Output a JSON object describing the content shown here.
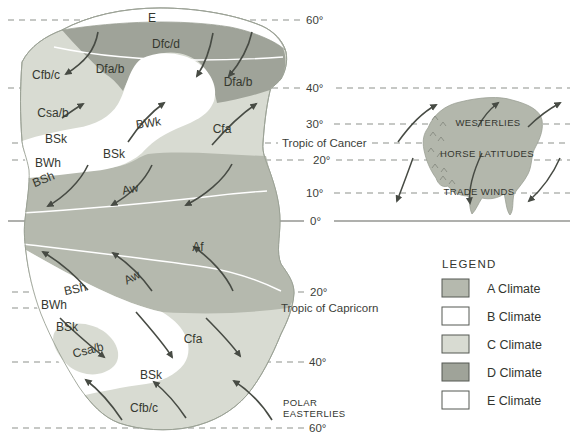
{
  "colors": {
    "background": "#ffffff",
    "a_climate": "#b5b9ae",
    "b_climate": "#ffffff",
    "c_climate": "#d8dbd2",
    "d_climate": "#9fa399",
    "e_climate": "#ffffff",
    "inset_land": "#b3b7ac",
    "coastline": "#9aa094",
    "latitude_line": "#8e918b",
    "equator_line": "#60635d",
    "arrow": "#474b44",
    "legend_border": "#55585200"
  },
  "climate_zone_labels": [
    {
      "text": "E"
    },
    {
      "text": "Dfc/d"
    },
    {
      "text": "Dfa/b"
    },
    {
      "text": "Dfa/b"
    },
    {
      "text": "Cfb/c"
    },
    {
      "text": "Csa/b"
    },
    {
      "text": "BWk"
    },
    {
      "text": "BSk"
    },
    {
      "text": "BSk"
    },
    {
      "text": "BWh"
    },
    {
      "text": "BSh"
    },
    {
      "text": "Cfa"
    },
    {
      "text": "Aw"
    },
    {
      "text": "Af"
    },
    {
      "text": "Aw"
    },
    {
      "text": "BSh"
    },
    {
      "text": "BWh"
    },
    {
      "text": "BSk"
    },
    {
      "text": "Csa/b"
    },
    {
      "text": "Cfa"
    },
    {
      "text": "BSk"
    },
    {
      "text": "Cfb/c"
    }
  ],
  "latitude_labels": [
    {
      "text": "60°"
    },
    {
      "text": "40°"
    },
    {
      "text": "30°"
    },
    {
      "text": "Tropic of Cancer"
    },
    {
      "text": "20°"
    },
    {
      "text": "10°"
    },
    {
      "text": "0°"
    },
    {
      "text": "20°"
    },
    {
      "text": "Tropic of Capricorn"
    },
    {
      "text": "40°"
    },
    {
      "text": "60°"
    }
  ],
  "wind_labels": {
    "westerlies": "WESTERLIES",
    "horse_latitudes": "HORSE LATITUDES",
    "trade_winds": "TRADE WINDS",
    "polar_easterlies_line1": "POLAR",
    "polar_easterlies_line2": "EASTERLIES"
  },
  "legend": {
    "title": "LEGEND",
    "items": [
      {
        "label": "A Climate",
        "color_key": "a_climate"
      },
      {
        "label": "B Climate",
        "color_key": "b_climate"
      },
      {
        "label": "C Climate",
        "color_key": "c_climate"
      },
      {
        "label": "D Climate",
        "color_key": "d_climate"
      },
      {
        "label": "E Climate",
        "color_key": "e_climate"
      }
    ]
  }
}
